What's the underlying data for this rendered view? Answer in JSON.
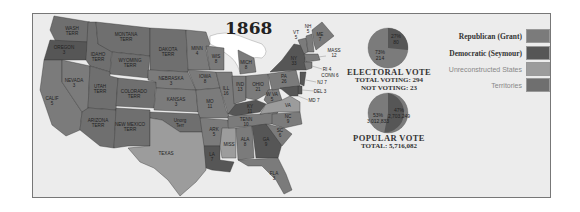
{
  "map": {
    "title": "1868",
    "colors": {
      "republican": "#7b7b7b",
      "democratic": "#565656",
      "unreconstructed": "#9c9c9c",
      "territories": "#6f6f6f",
      "background": "#ececec",
      "water": "#ffffff"
    },
    "states": [
      {
        "name": "WASH TERR",
        "votes": "",
        "party": "territories"
      },
      {
        "name": "OREGON",
        "votes": "3",
        "party": "democratic"
      },
      {
        "name": "CALIF",
        "votes": "5",
        "party": "republican"
      },
      {
        "name": "NEVADA",
        "votes": "3",
        "party": "republican"
      },
      {
        "name": "IDAHO TERR",
        "votes": "",
        "party": "territories"
      },
      {
        "name": "MONTANA TERR",
        "votes": "",
        "party": "territories"
      },
      {
        "name": "WYOMING TERR",
        "votes": "",
        "party": "territories"
      },
      {
        "name": "UTAH TERR",
        "votes": "",
        "party": "territories"
      },
      {
        "name": "COLORADO TERR",
        "votes": "",
        "party": "territories"
      },
      {
        "name": "ARIZONA TERR",
        "votes": "",
        "party": "territories"
      },
      {
        "name": "NEW MEXICO TERR",
        "votes": "",
        "party": "territories"
      },
      {
        "name": "DAKOTA TERR",
        "votes": "",
        "party": "territories"
      },
      {
        "name": "NEBRASKA",
        "votes": "3",
        "party": "republican"
      },
      {
        "name": "KANSAS",
        "votes": "3",
        "party": "republican"
      },
      {
        "name": "Unorg Terr",
        "votes": "",
        "party": "territories"
      },
      {
        "name": "TEXAS",
        "votes": "",
        "party": "unreconstructed"
      },
      {
        "name": "MINN",
        "votes": "4",
        "party": "republican"
      },
      {
        "name": "IOWA",
        "votes": "8",
        "party": "republican"
      },
      {
        "name": "MO",
        "votes": "11",
        "party": "republican"
      },
      {
        "name": "ARK",
        "votes": "5",
        "party": "republican"
      },
      {
        "name": "LA",
        "votes": "7",
        "party": "democratic"
      },
      {
        "name": "WIS",
        "votes": "8",
        "party": "republican"
      },
      {
        "name": "ILL",
        "votes": "16",
        "party": "republican"
      },
      {
        "name": "MISS",
        "votes": "",
        "party": "unreconstructed"
      },
      {
        "name": "MICH",
        "votes": "8",
        "party": "republican"
      },
      {
        "name": "IND",
        "votes": "13",
        "party": "republican"
      },
      {
        "name": "OHIO",
        "votes": "21",
        "party": "republican"
      },
      {
        "name": "KY",
        "votes": "11",
        "party": "democratic"
      },
      {
        "name": "TENN",
        "votes": "10",
        "party": "republican"
      },
      {
        "name": "ALA",
        "votes": "8",
        "party": "republican"
      },
      {
        "name": "GA",
        "votes": "9",
        "party": "democratic"
      },
      {
        "name": "FLA",
        "votes": "3",
        "party": "republican"
      },
      {
        "name": "W VA",
        "votes": "5",
        "party": "republican"
      },
      {
        "name": "VA",
        "votes": "",
        "party": "unreconstructed"
      },
      {
        "name": "NC",
        "votes": "9",
        "party": "republican"
      },
      {
        "name": "SC",
        "votes": "6",
        "party": "republican"
      },
      {
        "name": "PA",
        "votes": "26",
        "party": "republican"
      },
      {
        "name": "NY",
        "votes": "33",
        "party": "democratic"
      },
      {
        "name": "VT",
        "votes": "5",
        "party": "republican"
      },
      {
        "name": "NH",
        "votes": "5",
        "party": "republican"
      },
      {
        "name": "ME",
        "votes": "7",
        "party": "republican"
      },
      {
        "name": "MASS",
        "votes": "12",
        "party": "republican"
      },
      {
        "name": "RI",
        "votes": "4",
        "party": "republican"
      },
      {
        "name": "CONN",
        "votes": "6",
        "party": "republican"
      },
      {
        "name": "NJ",
        "votes": "7",
        "party": "democratic"
      },
      {
        "name": "DEL",
        "votes": "3",
        "party": "democratic"
      },
      {
        "name": "MD",
        "votes": "7",
        "party": "democratic"
      }
    ],
    "callouts": [
      "VT 5",
      "NH 5",
      "MASS 12",
      "RI 4",
      "CONN 6",
      "NJ 7",
      "DEL 3",
      "MD 7"
    ]
  },
  "electoral": {
    "title": "ELECTORAL VOTE",
    "total_voting": "TOTAL VOTING:  294",
    "not_voting": "NOT VOTING:  23",
    "slices": [
      {
        "label": "27%",
        "value": "80",
        "party": "democratic"
      },
      {
        "label": "73%",
        "value": "214",
        "party": "republican"
      }
    ]
  },
  "popular": {
    "title": "POPULAR VOTE",
    "total": "TOTAL:  5,716,082",
    "slices": [
      {
        "label": "47%",
        "value": "2,703,249",
        "party": "democratic"
      },
      {
        "label": "53%",
        "value": "3,012,833",
        "party": "republican"
      }
    ]
  },
  "legend": {
    "items": [
      {
        "label": "Republican (Grant)",
        "party": "republican"
      },
      {
        "label": "Democratic (Seymour)",
        "party": "democratic"
      },
      {
        "label": "Unreconstructed States",
        "party": "unreconstructed"
      },
      {
        "label": "Territories",
        "party": "territories"
      }
    ]
  }
}
